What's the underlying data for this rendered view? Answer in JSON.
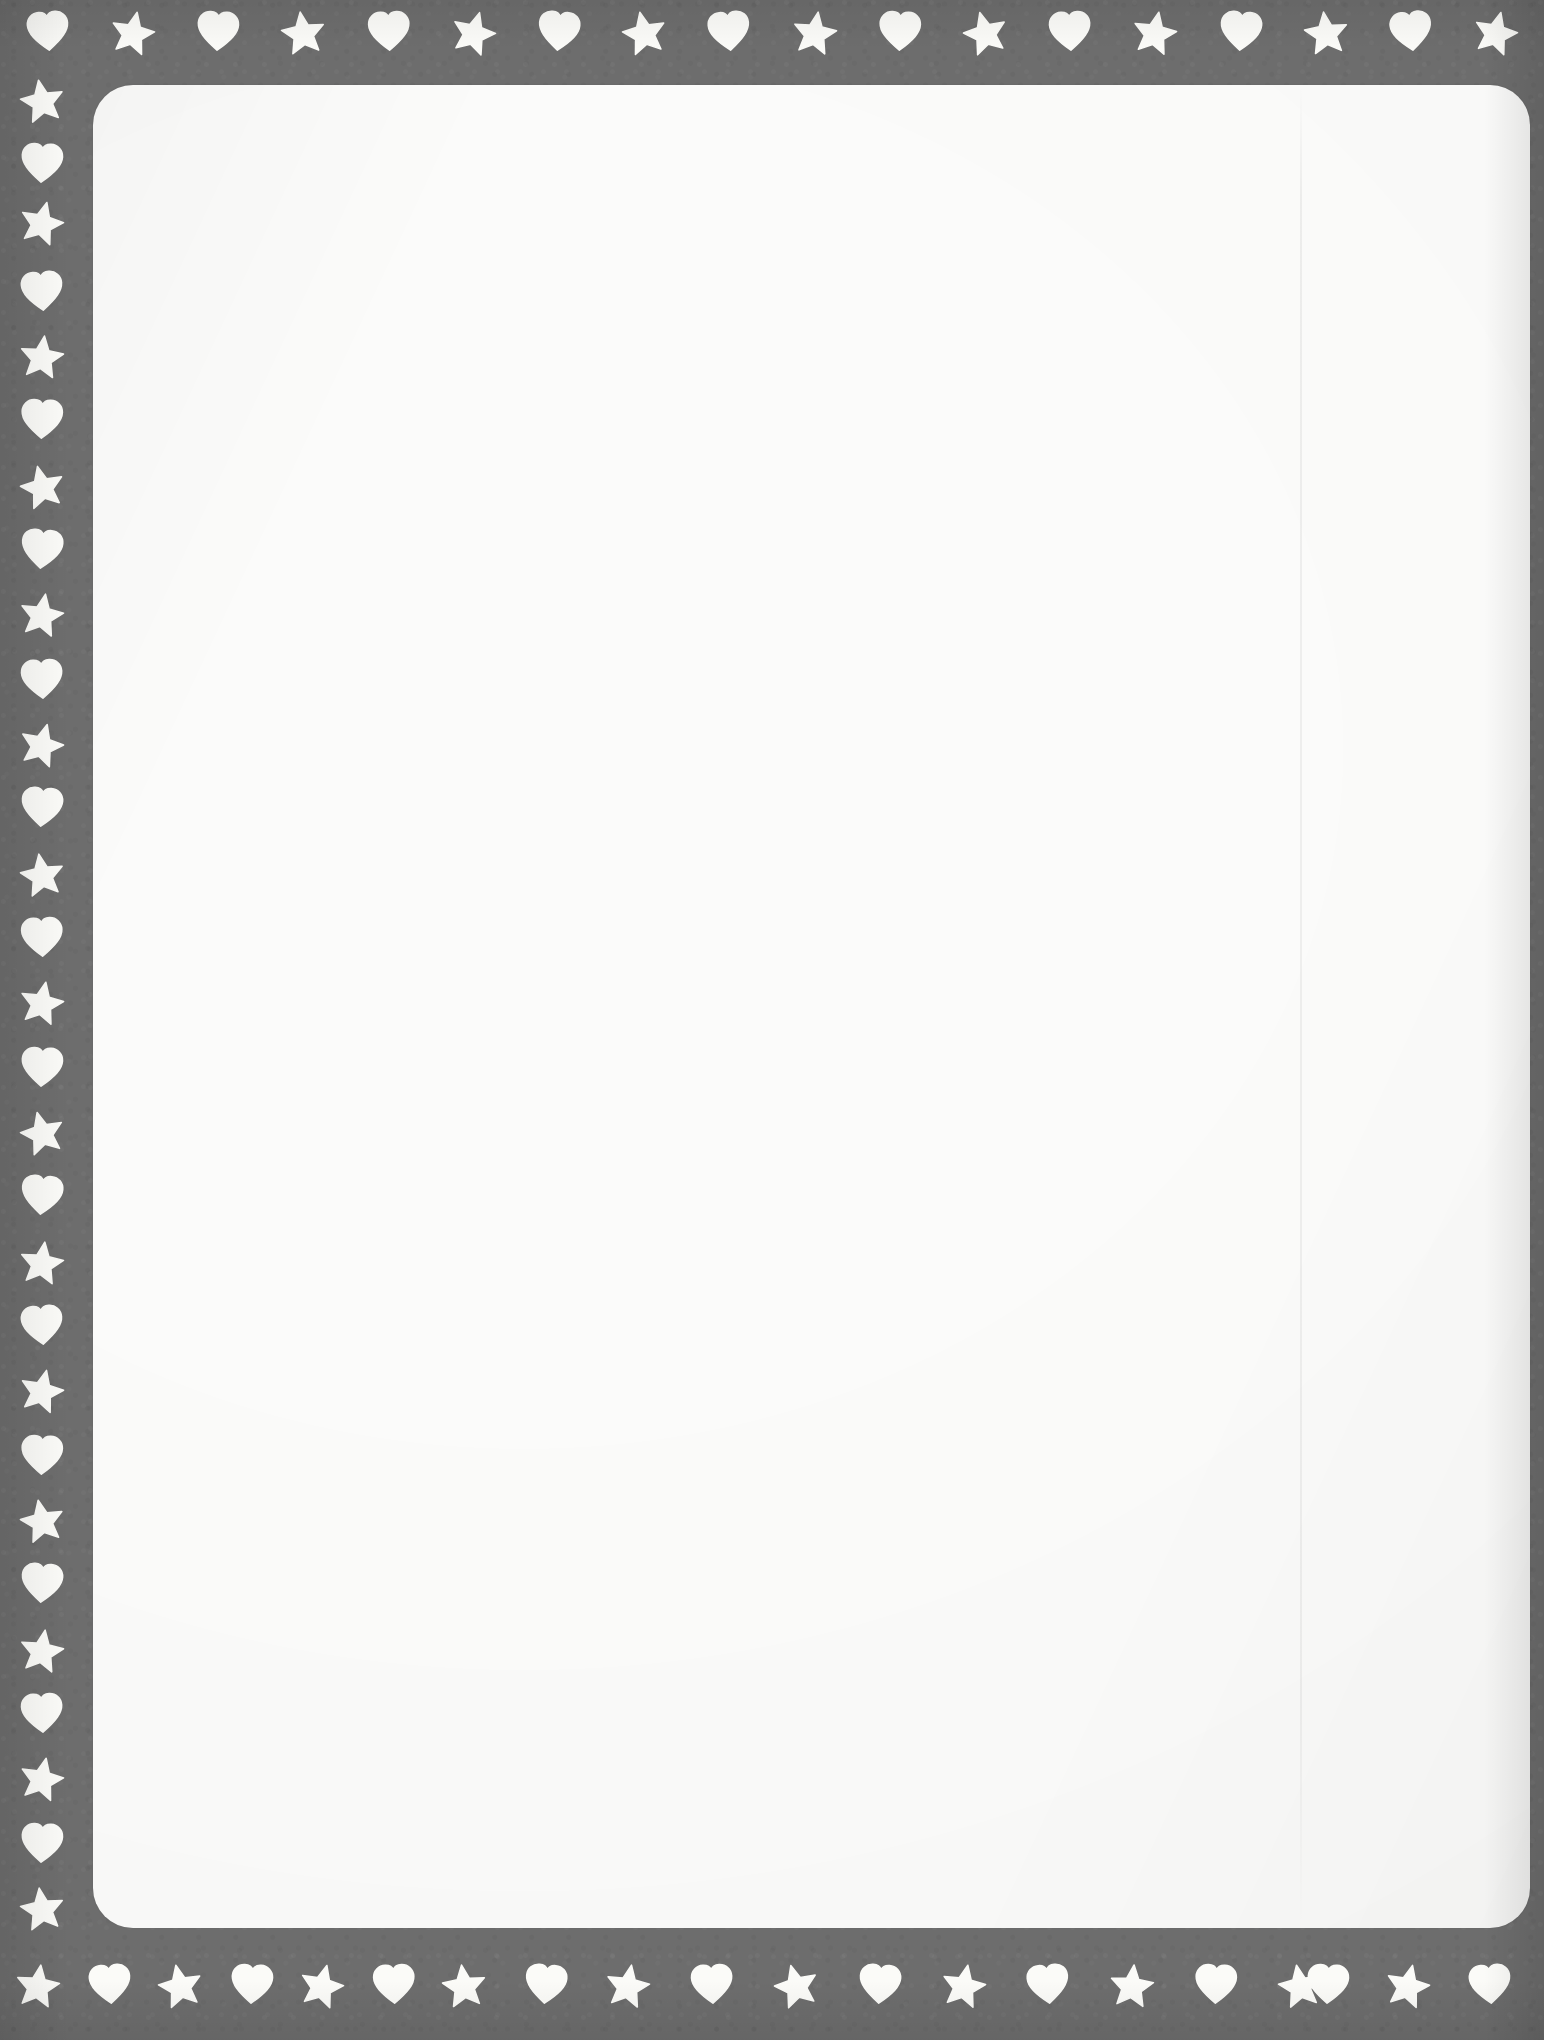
{
  "document": {
    "kind": "decorative-border-stationery",
    "title": "Hearts and Stars Border Stationery",
    "orientation": "portrait",
    "canvas": {
      "width": 1544,
      "height": 2040
    },
    "body_text": "",
    "visible_text": []
  },
  "colors": {
    "border_gray": "#6d6d6d",
    "ornament_white": "#fbfbf8",
    "writing_area": "#fbfbfa",
    "page_background": "#ffffff"
  },
  "writing_area": {
    "label": "blank writing area",
    "left": 93,
    "top": 85,
    "width": 1437,
    "height": 1843,
    "corner_radius": 40,
    "content": ""
  },
  "scan_seam": {
    "label": "faint vertical scanner seam",
    "x": 1300,
    "width": 2
  },
  "border": {
    "label": "gray border band with heart and star cut-outs",
    "thickness_left": 93,
    "thickness_top": 85,
    "thickness_bottom": 112,
    "thickness_right": 14,
    "motif_sequence": [
      "heart",
      "star"
    ],
    "icon_size": 46,
    "spacing": 85
  },
  "ornaments": {
    "top_row": {
      "label": "top border ornament row",
      "center_y": 32,
      "start_x": 48,
      "spacing": 85.2,
      "count": 18,
      "first_motif": "heart",
      "items": [
        {
          "motif": "heart",
          "name": "heart-icon",
          "x": 48,
          "rotate": -4
        },
        {
          "motif": "star",
          "name": "star-icon",
          "x": 133,
          "rotate": 12
        },
        {
          "motif": "heart",
          "name": "heart-icon",
          "x": 218,
          "rotate": 3
        },
        {
          "motif": "star",
          "name": "star-icon",
          "x": 303,
          "rotate": -8
        },
        {
          "motif": "heart",
          "name": "heart-icon",
          "x": 389,
          "rotate": -2
        },
        {
          "motif": "star",
          "name": "star-icon",
          "x": 474,
          "rotate": 16
        },
        {
          "motif": "heart",
          "name": "heart-icon",
          "x": 559,
          "rotate": 5
        },
        {
          "motif": "star",
          "name": "star-icon",
          "x": 644,
          "rotate": -12
        },
        {
          "motif": "heart",
          "name": "heart-icon",
          "x": 729,
          "rotate": -5
        },
        {
          "motif": "star",
          "name": "star-icon",
          "x": 815,
          "rotate": 9
        },
        {
          "motif": "heart",
          "name": "heart-icon",
          "x": 900,
          "rotate": 2
        },
        {
          "motif": "star",
          "name": "star-icon",
          "x": 985,
          "rotate": -15
        },
        {
          "motif": "heart",
          "name": "heart-icon",
          "x": 1070,
          "rotate": -3
        },
        {
          "motif": "star",
          "name": "star-icon",
          "x": 1155,
          "rotate": 11
        },
        {
          "motif": "heart",
          "name": "heart-icon",
          "x": 1241,
          "rotate": 4
        },
        {
          "motif": "star",
          "name": "star-icon",
          "x": 1326,
          "rotate": -7
        },
        {
          "motif": "heart",
          "name": "heart-icon",
          "x": 1411,
          "rotate": -6
        },
        {
          "motif": "star",
          "name": "star-icon",
          "x": 1496,
          "rotate": 14
        }
      ]
    },
    "left_column": {
      "label": "left border ornament column",
      "center_x": 42,
      "start_y": 100,
      "spacing": 85.5,
      "count": 22,
      "first_motif": "star",
      "items": [
        {
          "motif": "star",
          "name": "star-icon",
          "y": 100,
          "rotate": -10
        },
        {
          "motif": "heart",
          "name": "heart-icon",
          "y": 164,
          "rotate": 3
        },
        {
          "motif": "star",
          "name": "star-icon",
          "y": 222,
          "rotate": 14
        },
        {
          "motif": "heart",
          "name": "heart-icon",
          "y": 292,
          "rotate": -4
        },
        {
          "motif": "star",
          "name": "star-icon",
          "y": 356,
          "rotate": 7
        },
        {
          "motif": "heart",
          "name": "heart-icon",
          "y": 420,
          "rotate": 2
        },
        {
          "motif": "star",
          "name": "star-icon",
          "y": 486,
          "rotate": -13
        },
        {
          "motif": "heart",
          "name": "heart-icon",
          "y": 550,
          "rotate": 5
        },
        {
          "motif": "star",
          "name": "star-icon",
          "y": 614,
          "rotate": 10
        },
        {
          "motif": "heart",
          "name": "heart-icon",
          "y": 680,
          "rotate": -3
        },
        {
          "motif": "star",
          "name": "star-icon",
          "y": 744,
          "rotate": 15
        },
        {
          "motif": "heart",
          "name": "heart-icon",
          "y": 808,
          "rotate": 4
        },
        {
          "motif": "star",
          "name": "star-icon",
          "y": 874,
          "rotate": -9
        },
        {
          "motif": "heart",
          "name": "heart-icon",
          "y": 938,
          "rotate": -2
        },
        {
          "motif": "star",
          "name": "star-icon",
          "y": 1002,
          "rotate": 11
        },
        {
          "motif": "heart",
          "name": "heart-icon",
          "y": 1068,
          "rotate": 3
        },
        {
          "motif": "star",
          "name": "star-icon",
          "y": 1132,
          "rotate": -14
        },
        {
          "motif": "heart",
          "name": "heart-icon",
          "y": 1196,
          "rotate": 5
        },
        {
          "motif": "star",
          "name": "star-icon",
          "y": 1262,
          "rotate": 8
        },
        {
          "motif": "heart",
          "name": "heart-icon",
          "y": 1326,
          "rotate": -4
        },
        {
          "motif": "star",
          "name": "star-icon",
          "y": 1390,
          "rotate": 13
        },
        {
          "motif": "heart",
          "name": "heart-icon",
          "y": 1456,
          "rotate": 2
        },
        {
          "motif": "star",
          "name": "star-icon",
          "y": 1520,
          "rotate": -11
        },
        {
          "motif": "heart",
          "name": "heart-icon",
          "y": 1584,
          "rotate": 4
        },
        {
          "motif": "star",
          "name": "star-icon",
          "y": 1650,
          "rotate": 9
        },
        {
          "motif": "heart",
          "name": "heart-icon",
          "y": 1714,
          "rotate": -3
        },
        {
          "motif": "star",
          "name": "star-icon",
          "y": 1778,
          "rotate": 12
        },
        {
          "motif": "heart",
          "name": "heart-icon",
          "y": 1844,
          "rotate": 3
        },
        {
          "motif": "star",
          "name": "star-icon",
          "y": 1908,
          "rotate": -8
        }
      ]
    },
    "bottom_row": {
      "label": "bottom border ornament row",
      "center_y": 1985,
      "start_x": 38,
      "spacing": 85.2,
      "count": 18,
      "first_motif": "star",
      "items": [
        {
          "motif": "star",
          "name": "star-icon",
          "x": 38,
          "rotate": 8
        },
        {
          "motif": "heart",
          "name": "heart-icon",
          "x": 110,
          "rotate": -4
        },
        {
          "motif": "star",
          "name": "star-icon",
          "x": 180,
          "rotate": -12
        },
        {
          "motif": "heart",
          "name": "heart-icon",
          "x": 252,
          "rotate": 3
        },
        {
          "motif": "star",
          "name": "star-icon",
          "x": 322,
          "rotate": 14
        },
        {
          "motif": "heart",
          "name": "heart-icon",
          "x": 394,
          "rotate": -2
        },
        {
          "motif": "star",
          "name": "star-icon",
          "x": 464,
          "rotate": -7
        },
        {
          "motif": "heart",
          "name": "heart-icon",
          "x": 546,
          "rotate": 5
        },
        {
          "motif": "star",
          "name": "star-icon",
          "x": 628,
          "rotate": 10
        },
        {
          "motif": "heart",
          "name": "heart-icon",
          "x": 712,
          "rotate": -3
        },
        {
          "motif": "star",
          "name": "star-icon",
          "x": 796,
          "rotate": -15
        },
        {
          "motif": "heart",
          "name": "heart-icon",
          "x": 880,
          "rotate": 4
        },
        {
          "motif": "star",
          "name": "star-icon",
          "x": 964,
          "rotate": 11
        },
        {
          "motif": "heart",
          "name": "heart-icon",
          "x": 1048,
          "rotate": -5
        },
        {
          "motif": "star",
          "name": "star-icon",
          "x": 1132,
          "rotate": 6
        },
        {
          "motif": "heart",
          "name": "heart-icon",
          "x": 1216,
          "rotate": 2
        },
        {
          "motif": "star",
          "name": "star-icon",
          "x": 1300,
          "rotate": -10
        },
        {
          "motif": "heart",
          "name": "heart-icon",
          "x": 1328,
          "rotate": 3
        },
        {
          "motif": "star",
          "name": "star-icon",
          "x": 1408,
          "rotate": 13
        },
        {
          "motif": "heart",
          "name": "heart-icon",
          "x": 1490,
          "rotate": -4
        }
      ]
    }
  },
  "glyphs": {
    "heart": "M24,43 C10,32 3,24 3,15.5 C3,8.5 8.5,3 15.5,3 C19.8,3 23,5.2 24,8.2 C25,5.2 28.2,3 32.5,3 C39.5,3 45,8.5 45,15.5 C45,24 38,32 24,43 Z",
    "star": "M24,3 L30.4,17.6 L46,19.2 L34.2,29.8 L37.6,45 L24,37.2 L10.4,45 L13.8,29.8 L2,19.2 L17.6,17.6 Z"
  }
}
